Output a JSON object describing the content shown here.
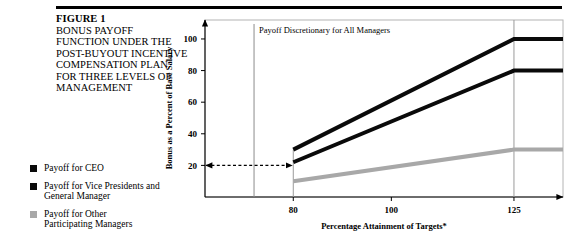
{
  "figure": {
    "number": "FIGURE 1",
    "caption_lines": [
      "BONUS PAYOFF",
      "FUNCTION UNDER THE",
      "POST-BUYOUT INCENTIVE",
      "COMPENSATION PLAN",
      "FOR THREE LEVELS OF",
      "MANAGEMENT"
    ]
  },
  "legend": {
    "items": [
      {
        "label_line1": "Payoff for CEO",
        "label_line2": "",
        "color": "#0a0a0a",
        "swatch": "black"
      },
      {
        "label_line1": "Payoff for Vice Presidents and",
        "label_line2": "General Manager",
        "color": "#0a0a0a",
        "swatch": "black"
      },
      {
        "label_line1": "Payoff for Other",
        "label_line2": "Participating Managers",
        "color": "#a8a8a8",
        "swatch": "gray"
      }
    ]
  },
  "chart_data": {
    "type": "line",
    "title": "",
    "xlabel": "Percentage Attainment of Targets*",
    "ylabel": "Bonus as a Percent of Base Salary",
    "x": [
      80,
      125,
      135
    ],
    "xlim": [
      62,
      135
    ],
    "ylim": [
      0,
      112
    ],
    "xticks": [
      80,
      100,
      125
    ],
    "xtick_labels": [
      "80",
      "100",
      "125"
    ],
    "yticks": [
      20,
      40,
      60,
      80,
      100
    ],
    "ytick_labels": [
      "20",
      "40",
      "60",
      "80",
      "100"
    ],
    "grid": false,
    "legend_position": "left-outside",
    "series": [
      {
        "name": "Payoff for CEO",
        "color": "#0a0a0a",
        "values": [
          30,
          100,
          100
        ]
      },
      {
        "name": "Payoff for Vice Presidents and General Manager",
        "color": "#0a0a0a",
        "values": [
          22,
          80,
          80
        ]
      },
      {
        "name": "Payoff for Other Participating Managers",
        "color": "#a8a8a8",
        "values": [
          10,
          30,
          30
        ]
      }
    ],
    "annotations": [
      {
        "name": "discretionary-note",
        "text": "Payoff Discretionary for All Managers",
        "x": 72,
        "y": 104
      },
      {
        "name": "discretionary-range-arrow",
        "text": "",
        "x_start": 62,
        "x_end": 80,
        "y": 20,
        "style": "dashed-double-arrow"
      }
    ],
    "vertical_reference_line": {
      "x": 72,
      "color": "#8c8c8c"
    }
  }
}
